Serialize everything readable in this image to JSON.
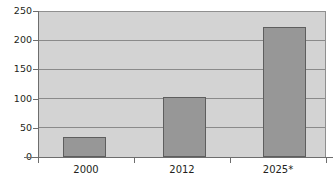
{
  "chart_data": {
    "type": "bar",
    "title": "",
    "subtitle": "",
    "xlabel": "",
    "ylabel": "",
    "categories": [
      "2000",
      "2012",
      "2025*"
    ],
    "values": [
      35,
      103,
      224
    ],
    "ylim": [
      0,
      250
    ],
    "yticks": [
      0,
      50,
      100,
      150,
      200,
      250
    ],
    "ytick_labels": [
      "0",
      "50",
      "100",
      "150",
      "200",
      "250"
    ],
    "grid": true,
    "grid_axis": "y",
    "legend": null,
    "annotations": [
      "* projected"
    ],
    "series": [
      {
        "name": "series-1",
        "values": [
          35,
          103,
          224
        ]
      }
    ]
  },
  "style": {
    "plot_background": "#d3d3d3",
    "page_background": "#ffffff",
    "bar_fill": "#979797",
    "bar_stroke": "#5e5e5e",
    "gridline_color": "#8a8a8a",
    "axis_color": "#6d6d6d",
    "text_color": "#231f20"
  }
}
